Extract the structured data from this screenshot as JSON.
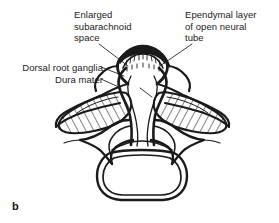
{
  "figure": {
    "panel_letter": "b",
    "background_color": "#ffffff",
    "ink_color": "#1a1a1a"
  },
  "labels": {
    "subarachnoid": {
      "text": "Enlarged\nsubarachnoid\nspace",
      "leader": "diagonal line from label down-right to enlarged subarachnoid space"
    },
    "ependymal": {
      "text": "Ependymal layer\nof open neural\ntube",
      "leader": "diagonal line from label down-left to hatched ependymal band"
    },
    "ganglia": {
      "text": "Dorsal root ganglia",
      "leader": "line from label right to hatched left ganglion"
    },
    "dura": {
      "text": "Dura mater",
      "leader": "line from label right to dura outline"
    }
  },
  "structures": [
    {
      "name": "open-neural-tube",
      "fill": "none",
      "note": "central vertical funnel, everted at top"
    },
    {
      "name": "ependymal-layer",
      "fill": "dark band with fine vertical ticks",
      "note": "arc across top of open tube"
    },
    {
      "name": "dorsal-root-ganglion-left",
      "fill": "diagonal hatching",
      "note": "elongated winged ellipse"
    },
    {
      "name": "dorsal-root-ganglion-right",
      "fill": "diagonal hatching",
      "note": "elongated winged ellipse"
    },
    {
      "name": "dura-mater",
      "fill": "none",
      "note": "outline sweeping around ganglia"
    },
    {
      "name": "vertebral-arch",
      "fill": "none",
      "note": "transverse processes and pedicles"
    },
    {
      "name": "vertebral-body",
      "fill": "none",
      "note": "rounded double-outlined block at bottom"
    }
  ]
}
